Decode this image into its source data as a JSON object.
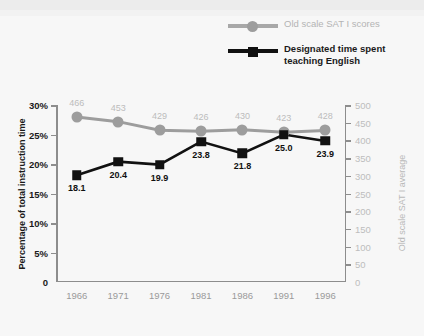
{
  "chart_data": {
    "type": "line",
    "title": "",
    "xlabel": "",
    "x": [
      1966,
      1971,
      1976,
      1981,
      1986,
      1991,
      1996
    ],
    "xticklabels": [
      "1966",
      "1971",
      "1976",
      "1981",
      "1986",
      "1991",
      "1996"
    ],
    "grid": false,
    "legend_position": "top-right",
    "axes": {
      "left": {
        "label": "Percentage of total instruction time",
        "ylim": [
          0,
          30
        ],
        "ticks": [
          0,
          5,
          10,
          15,
          20,
          25,
          30
        ],
        "ticklabels": [
          "0",
          "5%",
          "10%",
          "15%",
          "20%",
          "25%",
          "30%"
        ],
        "color": "#1a1a1a"
      },
      "right": {
        "label": "Old scale SAT I average",
        "ylim": [
          0,
          500
        ],
        "ticks": [
          0,
          50,
          100,
          150,
          200,
          250,
          300,
          350,
          400,
          450,
          500
        ],
        "ticklabels": [
          "0",
          "50",
          "100",
          "150",
          "200",
          "250",
          "300",
          "350",
          "400",
          "450",
          "500"
        ],
        "color": "#bdbdbd"
      }
    },
    "series": [
      {
        "name": "Old scale SAT I scores",
        "axis": "right",
        "marker": "circle",
        "color": "#9d9d9d",
        "label_color": "#bcbcbc",
        "values": [
          466,
          453,
          429,
          426,
          430,
          423,
          428
        ],
        "point_labels": [
          "466",
          "453",
          "429",
          "426",
          "430",
          "423",
          "428"
        ],
        "label_position": "above"
      },
      {
        "name": "Designated time spent teaching English",
        "axis": "left",
        "marker": "square",
        "color": "#111111",
        "label_color": "#101010",
        "values": [
          18.1,
          20.4,
          19.9,
          23.8,
          21.8,
          25.0,
          23.9
        ],
        "point_labels": [
          "18.1",
          "20.4",
          "19.9",
          "23.8",
          "21.8",
          "25.0",
          "23.9"
        ],
        "label_position": "below"
      }
    ]
  },
  "legend": {
    "items": [
      {
        "label": "Old scale SAT I scores",
        "marker": "circle",
        "color": "#9d9d9d"
      },
      {
        "label": "Designated time spent teaching English",
        "marker": "square",
        "color": "#111111"
      }
    ]
  }
}
